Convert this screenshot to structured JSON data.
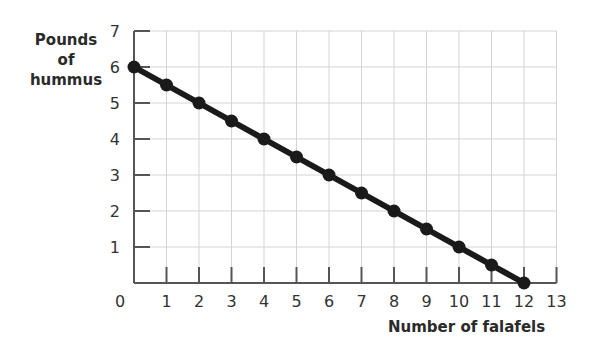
{
  "chart_data": {
    "type": "line",
    "title": "",
    "xlabel": "Number of falafels",
    "ylabel": "Pounds of hummus",
    "ylabel_lines": [
      "Pounds",
      "of",
      "hummus"
    ],
    "x_ticks": [
      0,
      1,
      2,
      3,
      4,
      5,
      6,
      7,
      8,
      9,
      10,
      11,
      12,
      13
    ],
    "y_ticks": [
      1,
      2,
      3,
      4,
      5,
      6,
      7
    ],
    "xlim": [
      0,
      13
    ],
    "ylim": [
      0,
      7
    ],
    "grid": true,
    "series": [
      {
        "name": "Production possibility frontier",
        "x": [
          0,
          1,
          2,
          3,
          4,
          5,
          6,
          7,
          8,
          9,
          10,
          11,
          12
        ],
        "y": [
          6,
          5.5,
          5,
          4.5,
          4,
          3.5,
          3,
          2.5,
          2,
          1.5,
          1,
          0.5,
          0
        ]
      }
    ],
    "colors": {
      "line": "#1a1a1a",
      "grid": "#d4d4d4",
      "axis": "#555555"
    }
  }
}
